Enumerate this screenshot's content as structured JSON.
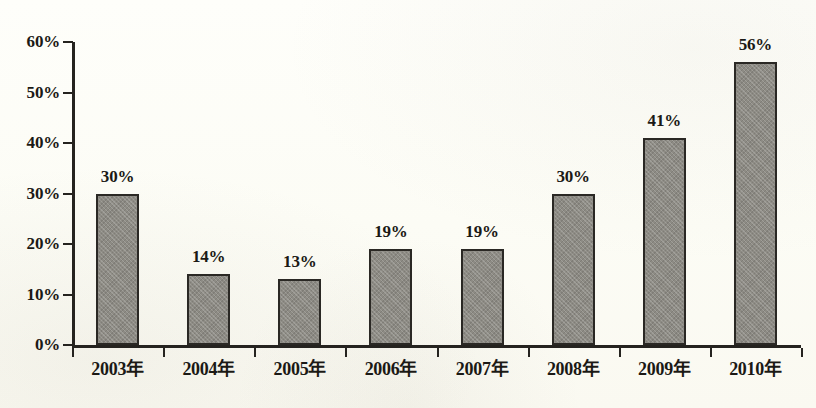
{
  "chart_data": {
    "type": "bar",
    "title": "",
    "xlabel": "",
    "ylabel": "",
    "categories": [
      "2003年",
      "2004年",
      "2005年",
      "2006年",
      "2007年",
      "2008年",
      "2009年",
      "2010年"
    ],
    "values": [
      30,
      14,
      13,
      19,
      19,
      30,
      41,
      56
    ],
    "value_labels": [
      "30%",
      "14%",
      "13%",
      "19%",
      "19%",
      "30%",
      "41%",
      "56%"
    ],
    "ylim": [
      0,
      60
    ],
    "ytick_values": [
      0,
      10,
      20,
      30,
      40,
      50,
      60
    ],
    "ytick_labels": [
      "0%",
      "10%",
      "20%",
      "30%",
      "40%",
      "50%",
      "60%"
    ],
    "grid": false,
    "legend": null,
    "bar_fill_color": "#8d8b84",
    "bar_border_color": "#2a2824",
    "axis_color": "#25231f",
    "background_color": "#fdfdf7",
    "text_color": "#1b1915"
  }
}
